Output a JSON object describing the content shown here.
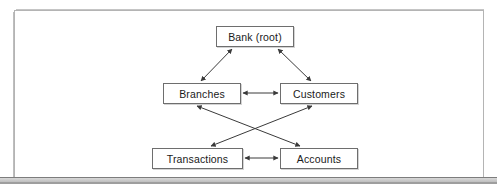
{
  "diagram": {
    "type": "node-link",
    "nodes": [
      {
        "id": "bank",
        "label": "Bank (root)",
        "x": 216,
        "y": 26,
        "w": 78,
        "h": 21
      },
      {
        "id": "branches",
        "label": "Branches",
        "x": 163,
        "y": 83,
        "w": 78,
        "h": 21
      },
      {
        "id": "customers",
        "label": "Customers",
        "x": 280,
        "y": 83,
        "w": 78,
        "h": 21
      },
      {
        "id": "transactions",
        "label": "Transactions",
        "x": 152,
        "y": 148,
        "w": 91,
        "h": 21
      },
      {
        "id": "accounts",
        "label": "Accounts",
        "x": 280,
        "y": 148,
        "w": 78,
        "h": 21
      }
    ],
    "edges": [
      {
        "from": "bank",
        "to": "branches",
        "style": "double-arrow",
        "direction": "bidirectional"
      },
      {
        "from": "bank",
        "to": "customers",
        "style": "double-arrow",
        "direction": "bidirectional"
      },
      {
        "from": "branches",
        "to": "customers",
        "style": "double-arrow",
        "direction": "bidirectional"
      },
      {
        "from": "branches",
        "to": "accounts",
        "style": "double-arrow",
        "direction": "bidirectional"
      },
      {
        "from": "customers",
        "to": "transactions",
        "style": "double-arrow",
        "direction": "bidirectional"
      },
      {
        "from": "transactions",
        "to": "accounts",
        "style": "double-arrow",
        "direction": "bidirectional"
      }
    ],
    "colors": {
      "node_border": "#6e6e6e",
      "node_fill": "#ffffff",
      "edge": "#3a3a3a",
      "frame_border": "#b4b4b4",
      "page_background": "#ffffff",
      "bottom_band": "#bfbfbf",
      "label_text": "#1a1a1a"
    }
  }
}
